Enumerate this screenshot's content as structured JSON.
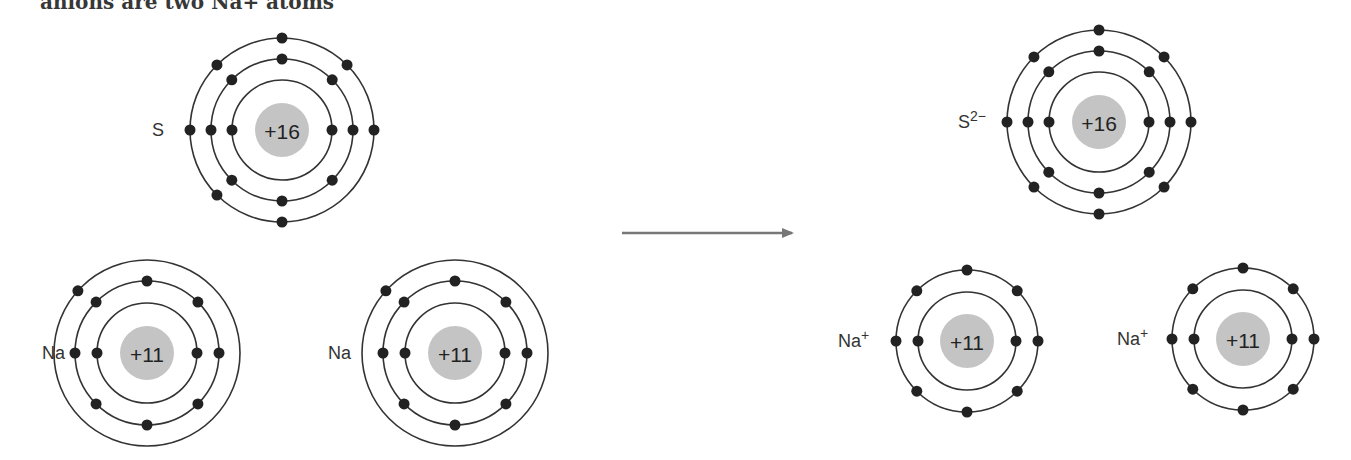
{
  "caption_fragment": "anions are two Na+ atoms",
  "arrow": {
    "from": [
      622,
      233
    ],
    "to": [
      792,
      233
    ],
    "color": "#777777"
  },
  "reactants": [
    {
      "id": "sulfur-atom",
      "symbol": "S",
      "charge_label": "+16",
      "cx": 282,
      "cy": 130,
      "label_x": 152,
      "label_y": 136,
      "shells": [
        {
          "r": 50,
          "electrons": [
            0,
            180
          ]
        },
        {
          "r": 71,
          "electrons": [
            0,
            45,
            90,
            135,
            180,
            225,
            270,
            315
          ]
        },
        {
          "r": 92,
          "electrons": [
            0,
            45,
            90,
            135,
            180,
            225,
            270
          ]
        }
      ]
    },
    {
      "id": "sodium-atom-1",
      "symbol": "Na",
      "charge_label": "+11",
      "cx": 147,
      "cy": 353,
      "label_x": 42,
      "label_y": 359,
      "shells": [
        {
          "r": 50,
          "electrons": [
            0,
            180
          ]
        },
        {
          "r": 72,
          "electrons": [
            0,
            45,
            90,
            135,
            180,
            225,
            270,
            315
          ]
        },
        {
          "r": 93,
          "electrons": [
            138
          ]
        }
      ]
    },
    {
      "id": "sodium-atom-2",
      "symbol": "Na",
      "charge_label": "+11",
      "cx": 455,
      "cy": 353,
      "label_x": 328,
      "label_y": 359,
      "shells": [
        {
          "r": 50,
          "electrons": [
            0,
            180
          ]
        },
        {
          "r": 72,
          "electrons": [
            0,
            45,
            90,
            135,
            180,
            225,
            270,
            315
          ]
        },
        {
          "r": 93,
          "electrons": [
            138
          ]
        }
      ]
    }
  ],
  "products": [
    {
      "id": "sulfide-ion",
      "symbol": "S",
      "superscript": "2−",
      "charge_label": "+16",
      "cx": 1099,
      "cy": 122,
      "label_x": 958,
      "label_y": 128,
      "shells": [
        {
          "r": 50,
          "electrons": [
            0,
            180
          ]
        },
        {
          "r": 71,
          "electrons": [
            0,
            45,
            90,
            135,
            180,
            225,
            270,
            315
          ]
        },
        {
          "r": 92,
          "electrons": [
            0,
            45,
            90,
            135,
            180,
            225,
            270,
            315
          ]
        }
      ]
    },
    {
      "id": "sodium-ion-1",
      "symbol": "Na",
      "superscript": "+",
      "charge_label": "+11",
      "cx": 967,
      "cy": 341,
      "label_x": 838,
      "label_y": 347,
      "shells": [
        {
          "r": 49,
          "electrons": [
            0,
            180
          ]
        },
        {
          "r": 71,
          "electrons": [
            0,
            45,
            90,
            135,
            180,
            225,
            270,
            315
          ]
        }
      ]
    },
    {
      "id": "sodium-ion-2",
      "symbol": "Na",
      "superscript": "+",
      "charge_label": "+11",
      "cx": 1243,
      "cy": 339,
      "label_x": 1117,
      "label_y": 345,
      "shells": [
        {
          "r": 49,
          "electrons": [
            0,
            180
          ]
        },
        {
          "r": 71,
          "electrons": [
            0,
            45,
            90,
            135,
            180,
            225,
            270,
            315
          ]
        }
      ]
    }
  ],
  "colors": {
    "orbit": "#333333",
    "electron": "#222222",
    "nucleus": "#c4c4c4",
    "text": "#333333"
  }
}
